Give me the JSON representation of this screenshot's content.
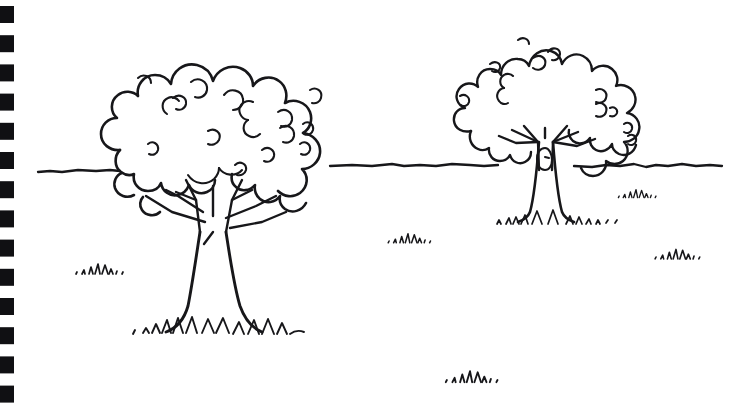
{
  "artwork": {
    "title": "Two trees landscape line drawing",
    "medium": "ink pen sketch on notebook paper",
    "background_color": "#ffffff",
    "ink_color": "#17171a",
    "canvas": {
      "width": 742,
      "height": 411
    }
  },
  "binding": {
    "name": "spiral notebook binding marks",
    "edge": "left",
    "mark_color": "#101013",
    "count": 14,
    "mark_width": 14,
    "mark_height": 17,
    "first_mark_y": 6,
    "spacing": 29.2,
    "left_offset": 0
  },
  "scene": {
    "horizon": {
      "label": "horizon line",
      "y": 170,
      "description": "wavy hand-drawn ground line spanning full width behind both trees"
    },
    "elements": [
      {
        "name": "near-tree",
        "label": "Large foreground tree (left)"
      },
      {
        "name": "far-tree",
        "label": "Smaller background tree (right)"
      },
      {
        "name": "grass-tufts",
        "label": "Scattered grass tufts"
      }
    ]
  },
  "near_tree": {
    "label": "Large foreground tree",
    "canopy": {
      "label": "Scalloped cloud-like foliage crown",
      "center_x": 222,
      "center_y": 140,
      "width": 232,
      "height": 160
    },
    "trunk": {
      "label": "Tapered trunk flaring at base",
      "top_y": 196,
      "base_y": 330,
      "base_x": 212
    },
    "branches": {
      "label": "Forking branch structure",
      "count": 7
    },
    "base_grass": {
      "label": "Grass and root tufts at trunk base",
      "y": 330
    }
  },
  "far_tree": {
    "label": "Smaller background tree",
    "canopy": {
      "label": "Scalloped cloud-like foliage crown",
      "center_x": 556,
      "center_y": 83,
      "width": 188,
      "height": 126
    },
    "trunk": {
      "label": "Short trunk crossing the horizon",
      "top_y": 128,
      "base_y": 222,
      "base_x": 545
    },
    "knot": {
      "label": "Knot hole marking on trunk",
      "x": 548,
      "y": 155
    },
    "base_grass": {
      "label": "Grass tufts at trunk base",
      "y": 222
    }
  },
  "grass_tufts": [
    {
      "name": "tuft-left-foreground",
      "x": 98,
      "y": 272,
      "scale": 1.0
    },
    {
      "name": "tuft-center-midground",
      "x": 408,
      "y": 241,
      "scale": 0.9
    },
    {
      "name": "tuft-center-foreground",
      "x": 470,
      "y": 380,
      "scale": 1.1
    },
    {
      "name": "tuft-right-midground",
      "x": 636,
      "y": 196,
      "scale": 0.8
    },
    {
      "name": "tuft-right-foreground",
      "x": 676,
      "y": 257,
      "scale": 0.95
    }
  ]
}
